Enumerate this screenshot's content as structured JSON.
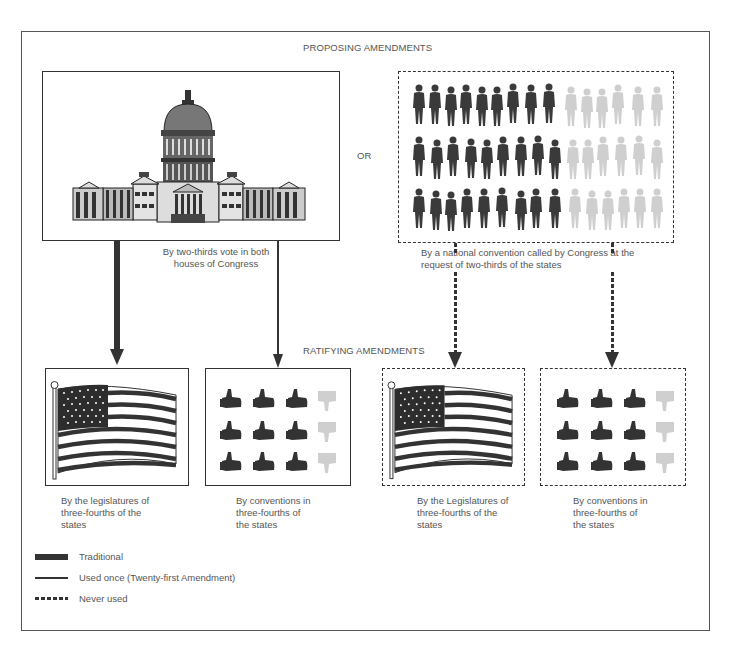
{
  "headings": {
    "proposing": "PROPOSING AMENDMENTS",
    "ratifying": "RATIFYING AMENDMENTS",
    "or": "OR"
  },
  "proposing_methods": [
    {
      "icon": "capitol-building-icon",
      "caption_lines": [
        "By two-thirds vote in both",
        "houses of Congress"
      ],
      "border": "solid"
    },
    {
      "icon": "people-crowd-icon",
      "caption_lines": [
        "By a national convention called by Congress at the",
        "request of two-thirds of the states"
      ],
      "border": "dashed",
      "crowd": {
        "rows": 3,
        "dark_per_row": 9,
        "light_per_row": 6
      }
    }
  ],
  "ratifying_methods": [
    {
      "icon": "american-flag-icon",
      "caption_lines": [
        "By the legislatures of",
        "three-fourths of the",
        "states"
      ],
      "border": "solid"
    },
    {
      "icon": "thumbs-grid-icon",
      "caption_lines": [
        "By conventions in",
        "three-fourths of",
        "the states"
      ],
      "border": "solid",
      "thumbs": {
        "rows": 3,
        "up_per_row": 3,
        "down_per_row": 1
      }
    },
    {
      "icon": "american-flag-icon",
      "caption_lines": [
        "By the Legislatures of",
        "three-fourths of the",
        "states"
      ],
      "border": "dashed"
    },
    {
      "icon": "thumbs-grid-icon",
      "caption_lines": [
        "By conventions in",
        "three-fourths of",
        "the states"
      ],
      "border": "dashed",
      "thumbs": {
        "rows": 3,
        "up_per_row": 3,
        "down_per_row": 1
      }
    }
  ],
  "arrows": [
    {
      "from": "Congress",
      "to": "State legislatures",
      "style": "thick",
      "meaning": "Traditional"
    },
    {
      "from": "Congress",
      "to": "State conventions",
      "style": "thin",
      "meaning": "Used once (Twenty-first Amendment)"
    },
    {
      "from": "National convention",
      "to": "State legislatures",
      "style": "dotted",
      "meaning": "Never used"
    },
    {
      "from": "National convention",
      "to": "State conventions",
      "style": "dotted",
      "meaning": "Never used"
    }
  ],
  "legend": [
    {
      "style": "thick",
      "label": "Traditional"
    },
    {
      "style": "thin",
      "label": "Used once (Twenty-first Amendment)"
    },
    {
      "style": "dotted",
      "label": "Never used"
    }
  ],
  "colors": {
    "ink": "#333333",
    "faded": "#c8c8c8",
    "text": "#555555"
  }
}
